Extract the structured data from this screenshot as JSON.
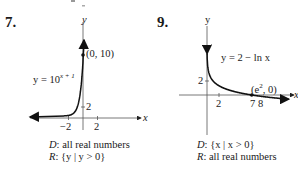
{
  "chart_data": [
    {
      "type": "line",
      "problem_number": "7.",
      "equation_label": "y = 10^(x+1)",
      "function": "10^(x+1)",
      "xlabel": "x",
      "ylabel": "y",
      "x_ticks": [
        -2,
        2
      ],
      "y_ticks": [
        2
      ],
      "xlim": [
        -5,
        4.5
      ],
      "ylim": [
        -1.8,
        16
      ],
      "curve_direction": "increasing, horizontal asymptote y = 0 to the left",
      "points": [
        {
          "x": 0,
          "y": 10,
          "label": "(0, 10)"
        }
      ],
      "domain_text": "all real numbers",
      "range_text": "{y | y > 0}"
    },
    {
      "type": "line",
      "problem_number": "9.",
      "equation_label": "y = 2 − ln x",
      "function": "2 - ln(x)",
      "xlabel": "x",
      "ylabel": "y",
      "x_ticks": [
        2,
        7,
        8
      ],
      "y_ticks": [
        2
      ],
      "xlim": [
        -0.5,
        11
      ],
      "ylim": [
        -5,
        8
      ],
      "curve_direction": "decreasing, vertical asymptote x = 0",
      "points": [
        {
          "x": 7.389,
          "y": 0,
          "label": "(e², 0)"
        }
      ],
      "domain_text": "{x | x > 0}",
      "range_text": "all real numbers"
    }
  ],
  "labels": {
    "p7": {
      "number": "7.",
      "eq_prefix": "y = 10",
      "eq_exp": "x + 1",
      "point": "(0, 10)",
      "axis_x": "x",
      "axis_y": "y",
      "tick_x_neg": "−2",
      "tick_x_pos": "2",
      "tick_y": "2",
      "d_key": "D",
      "d_val": ": all real numbers",
      "r_key": "R",
      "r_val": ": {y | y > 0}"
    },
    "p9": {
      "number": "9.",
      "eq": "y = 2 − ln x",
      "point_prefix": "(e",
      "point_sup": "2",
      "point_suffix": ", 0)",
      "axis_x": "x",
      "axis_y": "y",
      "tick_x_2": "2",
      "tick_x_78": "7 8",
      "tick_y": "2",
      "d_key": "D",
      "d_val": ": {x | x > 0}",
      "r_key": "R",
      "r_val": ": all real numbers"
    }
  }
}
